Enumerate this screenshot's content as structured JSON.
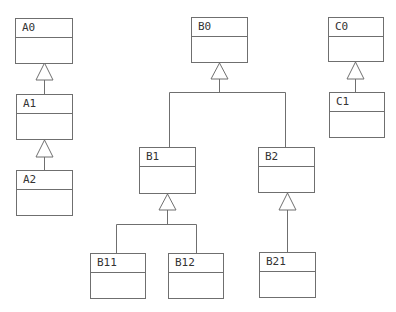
{
  "diagram": {
    "type": "uml-class-inheritance",
    "colors": {
      "stroke": "#6f6f6f",
      "text": "#333333",
      "background": "#ffffff"
    },
    "classes": {
      "A0": {
        "name": "A0"
      },
      "A1": {
        "name": "A1"
      },
      "A2": {
        "name": "A2"
      },
      "B0": {
        "name": "B0"
      },
      "B1": {
        "name": "B1"
      },
      "B2": {
        "name": "B2"
      },
      "B11": {
        "name": "B11"
      },
      "B12": {
        "name": "B12"
      },
      "B21": {
        "name": "B21"
      },
      "C0": {
        "name": "C0"
      },
      "C1": {
        "name": "C1"
      }
    },
    "inheritance": [
      {
        "child": "A1",
        "parent": "A0"
      },
      {
        "child": "A2",
        "parent": "A1"
      },
      {
        "child": "B1",
        "parent": "B0"
      },
      {
        "child": "B2",
        "parent": "B0"
      },
      {
        "child": "B11",
        "parent": "B1"
      },
      {
        "child": "B12",
        "parent": "B1"
      },
      {
        "child": "B21",
        "parent": "B2"
      },
      {
        "child": "C1",
        "parent": "C0"
      }
    ]
  }
}
